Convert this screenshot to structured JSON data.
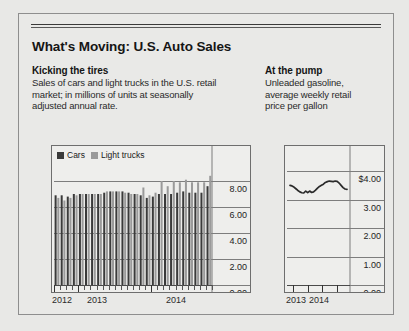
{
  "panel": {
    "title": "What's Moving: U.S. Auto Sales"
  },
  "left_section": {
    "heading": "Kicking the tires",
    "body_line1": "Sales of cars and light trucks in the U.S. retail",
    "body_line2": "market; in millions of units at seasonally",
    "body_line3": "adjusted annual rate."
  },
  "right_section": {
    "heading": "At the pump",
    "body_line1": "Unleaded gasoline,",
    "body_line2": "average weekly retail",
    "body_line3": "price per gallon"
  },
  "colors": {
    "cars": "#3a3a3a",
    "light_trucks": "#9a9a9a",
    "line": "#2a2a2a",
    "grid": "#7d7d7d",
    "panel_bg": "#e9e9e7",
    "chart_bg": "#eeeeec",
    "frame": "#8e8e8e"
  },
  "legend": {
    "items": [
      {
        "label": "Cars",
        "color": "#3a3a3a"
      },
      {
        "label": "Light trucks",
        "color": "#9a9a9a"
      }
    ]
  },
  "chart_data": [
    {
      "id": "auto-sales-bars",
      "type": "bar",
      "title": "Kicking the tires",
      "subtitle": "Sales of cars and light trucks in the U.S. retail market; in millions of units at seasonally adjusted annual rate.",
      "xlabel": "",
      "ylabel": "",
      "ylim": [
        0,
        9
      ],
      "yticks": [
        0,
        2,
        4,
        6,
        8
      ],
      "ytick_labels": [
        "0.00",
        "2.00",
        "4.00",
        "6.00",
        "8.00"
      ],
      "grid": true,
      "legend_position": "top-left",
      "x_tick_labels": [
        "2012",
        "2013",
        "2014"
      ],
      "x_tick_label_positions": [
        0,
        4,
        16
      ],
      "categories": [
        "2012-Q1",
        "2012-Q2",
        "2012-Q3",
        "2012-Q4",
        "2013-Q1",
        "2013-Q2",
        "2013-Q3",
        "2013-Q4",
        "2014-Q1",
        "2014-Q2",
        "2014-Q3",
        "2014-Q4",
        "2015-Q1",
        "2015-Q2",
        "2015-Q3",
        "2015-Q4",
        "2016-Q1",
        "2016-Q2",
        "2016-Q3",
        "2016-Q4",
        "2017-Q1",
        "2017-Q2",
        "2017-Q3",
        "2017-Q4",
        "2018-Q1",
        "2018-Q2"
      ],
      "series": [
        {
          "name": "Cars",
          "color": "#3a3a3a",
          "values": [
            6.9,
            6.9,
            6.8,
            7.0,
            7.0,
            7.0,
            7.0,
            7.0,
            7.1,
            7.2,
            7.2,
            7.2,
            7.1,
            7.0,
            6.9,
            6.7,
            6.8,
            7.0,
            7.0,
            7.0,
            7.1,
            7.2,
            7.1,
            7.1,
            7.1,
            7.6
          ]
        },
        {
          "name": "Light trucks",
          "color": "#9a9a9a",
          "values": [
            6.7,
            6.5,
            6.7,
            6.9,
            7.0,
            7.0,
            7.0,
            7.0,
            7.2,
            7.2,
            7.2,
            7.1,
            7.0,
            7.0,
            7.5,
            6.9,
            7.1,
            8.0,
            7.6,
            8.0,
            7.9,
            8.1,
            7.9,
            7.9,
            7.9,
            8.4
          ]
        }
      ]
    },
    {
      "id": "gasoline-price-line",
      "type": "line",
      "title": "At the pump",
      "subtitle": "Unleaded gasoline, average weekly retail price per gallon",
      "xlabel": "",
      "ylabel": "",
      "ylim": [
        0,
        4.6
      ],
      "yticks": [
        0,
        1,
        2,
        3,
        4
      ],
      "ytick_labels": [
        "0.00",
        "1.00",
        "2.00",
        "3.00",
        "$4.00"
      ],
      "grid": true,
      "x_tick_labels": [
        "2013",
        "2014"
      ],
      "series": [
        {
          "name": "Unleaded gasoline price per gallon",
          "color": "#2a2a2a",
          "x": [
            0,
            1,
            2,
            3,
            4,
            5,
            6,
            7,
            8,
            9,
            10,
            11,
            12,
            13,
            14,
            15,
            16,
            17,
            18,
            19,
            20,
            21,
            22,
            23,
            24,
            25,
            26,
            27,
            28,
            29
          ],
          "values": [
            3.5,
            3.48,
            3.44,
            3.38,
            3.32,
            3.27,
            3.24,
            3.23,
            3.3,
            3.24,
            3.3,
            3.25,
            3.27,
            3.33,
            3.4,
            3.46,
            3.5,
            3.54,
            3.6,
            3.63,
            3.65,
            3.64,
            3.63,
            3.65,
            3.64,
            3.58,
            3.5,
            3.42,
            3.37,
            3.36
          ]
        }
      ]
    }
  ]
}
